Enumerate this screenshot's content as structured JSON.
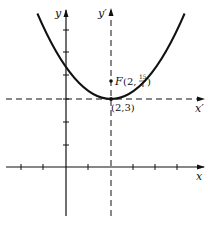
{
  "diagram": {
    "type": "parabola-translation-of-axes",
    "axes": {
      "x_label": "x",
      "y_label": "y",
      "x_prime_label": "x′",
      "y_prime_label": "y′"
    },
    "vertex": {
      "label": "(2,3)",
      "x": 2,
      "y": 3
    },
    "focus": {
      "label_prefix": "F(2, ",
      "num": "15",
      "den": "4",
      "label_suffix": ")",
      "x": 2,
      "y": 3.75
    },
    "parabola": {
      "equation": "(x-2)^2 = 3(y-3)"
    },
    "ticks": {
      "x": [
        -2,
        -1,
        1,
        2,
        3,
        4,
        5
      ],
      "y": [
        1,
        2,
        3,
        4,
        5,
        6
      ]
    },
    "colors": {
      "ink": "#111111",
      "background": "#ffffff"
    }
  }
}
